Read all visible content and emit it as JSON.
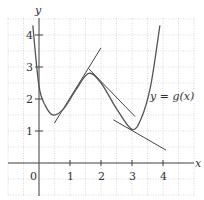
{
  "chart_data": {
    "type": "line",
    "title": "",
    "xlabel": "x",
    "ylabel": "y",
    "curve_label": "y = g(x)",
    "xlim": [
      -1,
      5
    ],
    "ylim": [
      -1,
      4.6
    ],
    "x_ticks": [
      "0",
      "1",
      "2",
      "3",
      "4"
    ],
    "y_ticks": [
      "1",
      "2",
      "3",
      "4"
    ],
    "grid": "dotted, every 0.5 unit",
    "series": [
      {
        "name": "g(x)",
        "points": [
          [
            -0.2,
            4.3
          ],
          [
            0,
            2.4
          ],
          [
            0.2,
            1.8
          ],
          [
            0.45,
            1.5
          ],
          [
            0.8,
            1.7
          ],
          [
            1.2,
            2.3
          ],
          [
            1.6,
            2.8
          ],
          [
            2.0,
            2.5
          ],
          [
            2.5,
            1.7
          ],
          [
            3.0,
            1.05
          ],
          [
            3.3,
            1.4
          ],
          [
            3.6,
            2.4
          ],
          [
            3.9,
            4.3
          ]
        ]
      }
    ],
    "tangent_lines": [
      {
        "name": "tangent near inflection x≈1.1",
        "from": [
          0.5,
          1.25
        ],
        "to": [
          2.0,
          3.6
        ]
      },
      {
        "name": "tangent near max x≈1.6",
        "from": [
          1.6,
          2.95
        ],
        "to": [
          3.1,
          1.45
        ]
      },
      {
        "name": "tangent at min x=3",
        "from": [
          2.4,
          1.35
        ],
        "to": [
          4.1,
          0.4
        ]
      }
    ]
  }
}
